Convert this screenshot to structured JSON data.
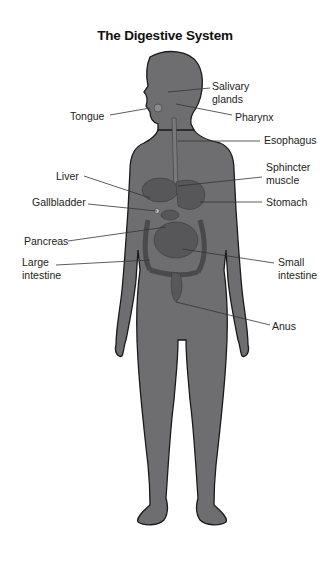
{
  "title": "The Digestive System",
  "colors": {
    "body_fill": "#6e6e70",
    "body_outline": "#1a1a1a",
    "organ_fill": "#5a5a5c",
    "leader_line": "#333333",
    "background": "#ffffff"
  },
  "labels": {
    "salivary_glands": "Salivary\nglands",
    "salivary_1": "Salivary",
    "salivary_2": "glands",
    "tongue": "Tongue",
    "pharynx": "Pharynx",
    "esophagus": "Esophagus",
    "sphincter_1": "Sphincter",
    "sphincter_2": "muscle",
    "liver": "Liver",
    "gallbladder": "Gallbladder",
    "stomach": "Stomach",
    "pancreas": "Pancreas",
    "large_intestine_1": "Large",
    "large_intestine_2": "intestine",
    "small_intestine_1": "Small",
    "small_intestine_2": "intestine",
    "anus": "Anus"
  }
}
